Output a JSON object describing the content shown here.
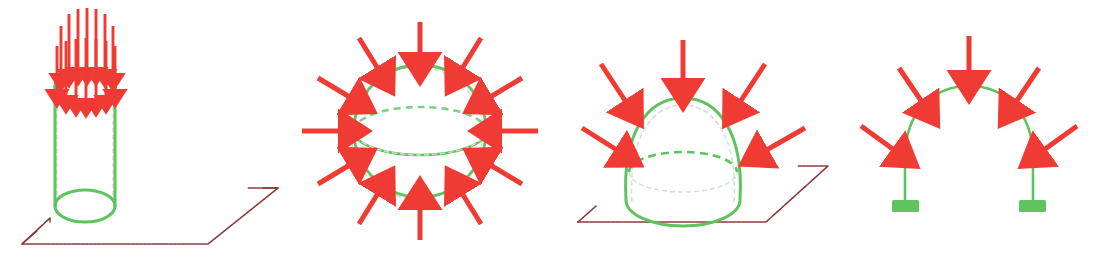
{
  "canvas": {
    "width": 1111,
    "height": 273,
    "background": "#ffffff",
    "title": "Compression load diagrams for shell structures"
  },
  "colors": {
    "structure_green": "#5fc45f",
    "structure_green_dashed": "#7fcf8a",
    "hidden_dashed_gray": "#b9c6cf",
    "load_red": "#ef3b33",
    "ground_maroon": "#8b3a3a"
  },
  "figures": [
    {
      "id": "cylinder",
      "name": "Cylindrical shell under axial compression",
      "shape": "cylinder",
      "stroke": "#5fc45f",
      "arrow_color": "#ef3b33",
      "ground_plane": true,
      "ground_color": "#8b3a3a",
      "arrow_count": 13,
      "arrow_direction": "downward",
      "arrow_rows": [
        7,
        6
      ],
      "support": "ground-plane",
      "offset_x": 0
    },
    {
      "id": "sphere",
      "name": "Spherical shell under radial compression",
      "shape": "sphere",
      "stroke": "#5fc45f",
      "arrow_color": "#ef3b33",
      "ground_plane": false,
      "ground_color": "#8b3a3a",
      "arrow_count": 12,
      "arrow_direction": "inward-radial",
      "support": "none",
      "offset_x": 288
    },
    {
      "id": "dome",
      "name": "Hemispherical dome on ground plane",
      "shape": "dome",
      "stroke": "#5fc45f",
      "arrow_color": "#ef3b33",
      "ground_plane": true,
      "ground_color": "#8b3a3a",
      "arrow_count": 5,
      "arrow_direction": "inward-radial",
      "support": "ground-plane",
      "offset_x": 560
    },
    {
      "id": "arch",
      "name": "Arch with footing supports",
      "shape": "arch",
      "stroke": "#5fc45f",
      "arrow_color": "#ef3b33",
      "ground_plane": false,
      "ground_color": "#8b3a3a",
      "arrow_count": 5,
      "arrow_direction": "inward-radial",
      "support": "footing-blocks",
      "footing_color": "#5fc45f",
      "offset_x": 838
    }
  ],
  "legend": {
    "load_label": "",
    "structure_label": "",
    "ground_label": ""
  }
}
